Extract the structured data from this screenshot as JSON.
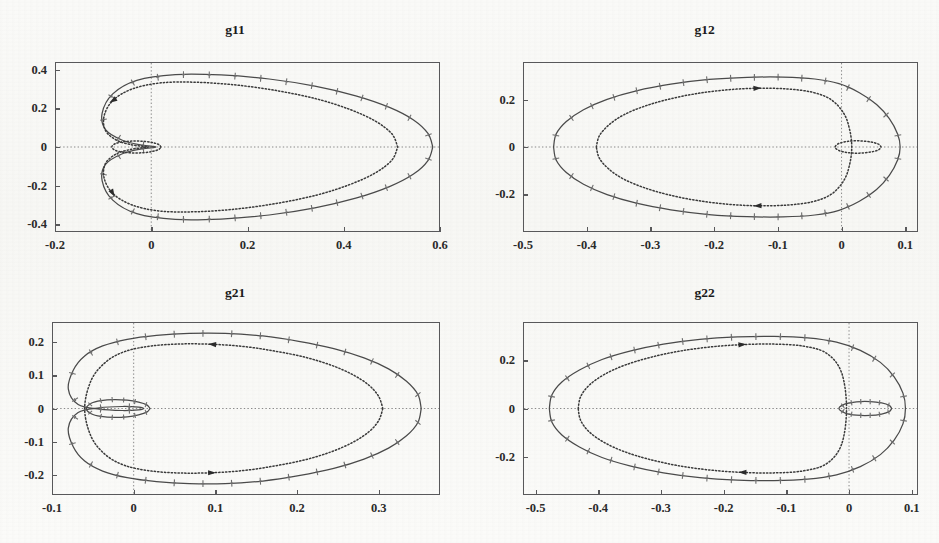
{
  "figure": {
    "background_color": "#fbfbf9",
    "axis_color": "#58585a",
    "solid_curve_color": "#4a4a4a",
    "dotted_curve_color": "#3a3a3a",
    "marker_color": "#6e6e6e",
    "panel_count": 4
  },
  "panels": [
    {
      "id": "g11",
      "title": "g11",
      "xticks": [
        "-0.2",
        "0",
        "0.2",
        "0.4",
        "0.6"
      ],
      "xtick_values": [
        -0.2,
        0,
        0.2,
        0.4,
        0.6
      ],
      "yticks": [
        "0.4",
        "0.2",
        "0",
        "-0.2",
        "-0.4"
      ],
      "ytick_values": [
        0.4,
        0.2,
        0,
        -0.2,
        -0.4
      ],
      "xlim": [
        -0.2,
        0.6
      ],
      "ylim": [
        -0.44,
        0.44
      ]
    },
    {
      "id": "g12",
      "title": "g12",
      "xticks": [
        "-0.5",
        "-0.4",
        "-0.3",
        "-0.2",
        "-0.1",
        "0",
        "0.1"
      ],
      "xtick_values": [
        -0.5,
        -0.4,
        -0.3,
        -0.2,
        -0.1,
        0,
        0.1
      ],
      "yticks": [
        "0.2",
        "0",
        "-0.2"
      ],
      "ytick_values": [
        0.2,
        0,
        -0.2
      ],
      "xlim": [
        -0.5,
        0.12
      ],
      "ylim": [
        -0.36,
        0.36
      ]
    },
    {
      "id": "g21",
      "title": "g21",
      "xticks": [
        "-0.1",
        "0",
        "0.1",
        "0.2",
        "0.3"
      ],
      "xtick_values": [
        -0.1,
        0,
        0.1,
        0.2,
        0.3
      ],
      "yticks": [
        "0.2",
        "0.1",
        "0",
        "-0.1",
        "-0.2"
      ],
      "ytick_values": [
        0.2,
        0.1,
        0,
        -0.1,
        -0.2
      ],
      "xlim": [
        -0.1,
        0.375
      ],
      "ylim": [
        -0.26,
        0.26
      ]
    },
    {
      "id": "g22",
      "title": "g22",
      "xticks": [
        "-0.5",
        "-0.4",
        "-0.3",
        "-0.2",
        "-0.1",
        "0",
        "0.1"
      ],
      "xtick_values": [
        -0.5,
        -0.4,
        -0.3,
        -0.2,
        -0.1,
        0,
        0.1
      ],
      "yticks": [
        "0.2",
        "0",
        "-0.2"
      ],
      "ytick_values": [
        0.2,
        0,
        -0.2
      ],
      "xlim": [
        -0.52,
        0.11
      ],
      "ylim": [
        -0.36,
        0.36
      ]
    }
  ],
  "chart_data": [
    {
      "type": "line",
      "title": "g11",
      "xlabel": "",
      "ylabel": "",
      "xlim": [
        -0.2,
        0.6
      ],
      "ylim": [
        -0.44,
        0.44
      ],
      "xticks": [
        -0.2,
        0,
        0.2,
        0.4,
        0.6
      ],
      "yticks": [
        -0.4,
        -0.2,
        0,
        0.2,
        0.4
      ],
      "grid": false,
      "legend": "none",
      "annotations": [
        "dotted crosshair lines at x=0 and y=0"
      ],
      "series": [
        {
          "name": "outer-solid-with-plus-markers",
          "style": "solid",
          "marker": "plus",
          "shape": "cardioid-outer-loop",
          "x": [
            0.585,
            0.575,
            0.545,
            0.495,
            0.425,
            0.34,
            0.245,
            0.145,
            0.05,
            -0.03,
            -0.08,
            -0.102,
            -0.095,
            -0.06,
            -0.02,
            0.005,
            0.01,
            0.005,
            -0.02,
            -0.06,
            -0.095,
            -0.102,
            -0.08,
            -0.03,
            0.05,
            0.145,
            0.245,
            0.34,
            0.425,
            0.495,
            0.545,
            0.575,
            0.585
          ],
          "y": [
            0.0,
            0.07,
            0.14,
            0.205,
            0.265,
            0.315,
            0.352,
            0.373,
            0.375,
            0.345,
            0.275,
            0.175,
            0.09,
            0.035,
            0.01,
            0.003,
            0.0,
            -0.003,
            -0.01,
            -0.035,
            -0.09,
            -0.175,
            -0.275,
            -0.345,
            -0.375,
            -0.373,
            -0.352,
            -0.315,
            -0.265,
            -0.205,
            -0.14,
            -0.07,
            0.0
          ]
        },
        {
          "name": "inner-dotted-loop",
          "style": "dotted",
          "marker": "arrow",
          "shape": "inner-ellipse",
          "x": [
            0.512,
            0.5,
            0.465,
            0.412,
            0.345,
            0.265,
            0.18,
            0.095,
            0.02,
            -0.04,
            -0.08,
            -0.098,
            -0.095,
            -0.072,
            -0.042,
            -0.018,
            -0.006,
            -0.018,
            -0.042,
            -0.072,
            -0.095,
            -0.098,
            -0.08,
            -0.04,
            0.02,
            0.095,
            0.18,
            0.265,
            0.345,
            0.412,
            0.465,
            0.5,
            0.512
          ],
          "y": [
            0.0,
            0.068,
            0.135,
            0.195,
            0.248,
            0.29,
            0.32,
            0.335,
            0.332,
            0.3,
            0.24,
            0.16,
            0.085,
            0.035,
            0.012,
            0.004,
            0.0,
            -0.004,
            -0.012,
            -0.035,
            -0.085,
            -0.16,
            -0.24,
            -0.3,
            -0.332,
            -0.335,
            -0.32,
            -0.29,
            -0.248,
            -0.195,
            -0.135,
            -0.068,
            0.0
          ]
        },
        {
          "name": "small-dotted-lobe-near-origin",
          "style": "dotted",
          "marker": "none",
          "shape": "small-ellipse",
          "x": [
            0.02,
            0.016,
            0.004,
            -0.014,
            -0.036,
            -0.058,
            -0.074,
            -0.082,
            -0.074,
            -0.058,
            -0.036,
            -0.014,
            0.004,
            0.016,
            0.02
          ],
          "y": [
            0.0,
            0.012,
            0.022,
            0.029,
            0.031,
            0.027,
            0.018,
            0.0,
            -0.018,
            -0.027,
            -0.031,
            -0.029,
            -0.022,
            -0.012,
            0.0
          ]
        }
      ]
    },
    {
      "type": "line",
      "title": "g12",
      "xlabel": "",
      "ylabel": "",
      "xlim": [
        -0.5,
        0.12
      ],
      "ylim": [
        -0.36,
        0.36
      ],
      "xticks": [
        -0.5,
        -0.4,
        -0.3,
        -0.2,
        -0.1,
        0,
        0.1
      ],
      "yticks": [
        -0.2,
        0,
        0.2
      ],
      "grid": false,
      "legend": "none",
      "annotations": [
        "dotted crosshair lines at x=0 and y=0"
      ],
      "series": [
        {
          "name": "outer-solid-with-plus-markers",
          "style": "solid",
          "marker": "plus",
          "shape": "cardioid-outer-loop",
          "x": [
            -0.452,
            -0.448,
            -0.432,
            -0.405,
            -0.368,
            -0.322,
            -0.268,
            -0.208,
            -0.148,
            -0.092,
            -0.042,
            -0.004,
            0.028,
            0.055,
            0.075,
            0.088,
            0.092,
            0.088,
            0.075,
            0.055,
            0.028,
            -0.004,
            -0.042,
            -0.092,
            -0.148,
            -0.208,
            -0.268,
            -0.322,
            -0.368,
            -0.405,
            -0.432,
            -0.448,
            -0.452
          ],
          "y": [
            0.0,
            0.055,
            0.108,
            0.158,
            0.202,
            0.238,
            0.266,
            0.286,
            0.295,
            0.296,
            0.288,
            0.268,
            0.23,
            0.18,
            0.12,
            0.055,
            0.0,
            -0.055,
            -0.12,
            -0.18,
            -0.23,
            -0.268,
            -0.288,
            -0.296,
            -0.295,
            -0.286,
            -0.266,
            -0.238,
            -0.202,
            -0.158,
            -0.108,
            -0.055,
            0.0
          ]
        },
        {
          "name": "inner-dotted-loop",
          "style": "dotted",
          "marker": "arrow",
          "shape": "inner-ellipse",
          "x": [
            -0.385,
            -0.38,
            -0.365,
            -0.342,
            -0.31,
            -0.272,
            -0.228,
            -0.18,
            -0.132,
            -0.086,
            -0.046,
            -0.016,
            0.004,
            0.013,
            0.016,
            0.013,
            0.004,
            -0.016,
            -0.046,
            -0.086,
            -0.132,
            -0.18,
            -0.228,
            -0.272,
            -0.31,
            -0.342,
            -0.365,
            -0.38,
            -0.385
          ],
          "y": [
            0.0,
            0.048,
            0.094,
            0.136,
            0.172,
            0.202,
            0.226,
            0.242,
            0.249,
            0.246,
            0.232,
            0.2,
            0.14,
            0.07,
            0.0,
            -0.07,
            -0.14,
            -0.2,
            -0.232,
            -0.246,
            -0.249,
            -0.242,
            -0.226,
            -0.202,
            -0.172,
            -0.136,
            -0.094,
            -0.048,
            0.0
          ]
        },
        {
          "name": "small-dotted-lobe-near-origin",
          "style": "dotted",
          "marker": "none",
          "shape": "small-ellipse",
          "x": [
            0.062,
            0.058,
            0.046,
            0.028,
            0.01,
            -0.004,
            -0.01,
            -0.004,
            0.01,
            0.028,
            0.046,
            0.058,
            0.062
          ],
          "y": [
            0.0,
            0.012,
            0.021,
            0.026,
            0.024,
            0.015,
            0.0,
            -0.015,
            -0.024,
            -0.026,
            -0.021,
            -0.012,
            0.0
          ]
        }
      ]
    },
    {
      "type": "line",
      "title": "g21",
      "xlabel": "",
      "ylabel": "",
      "xlim": [
        -0.1,
        0.375
      ],
      "ylim": [
        -0.26,
        0.26
      ],
      "xticks": [
        -0.1,
        0,
        0.1,
        0.2,
        0.3
      ],
      "yticks": [
        -0.2,
        -0.1,
        0,
        0.1,
        0.2
      ],
      "grid": false,
      "legend": "none",
      "annotations": [
        "dotted crosshair lines at x=0 and y=0"
      ],
      "series": [
        {
          "name": "outer-solid-with-plus-markers",
          "style": "solid",
          "marker": "plus",
          "shape": "cardioid-outer-loop",
          "x": [
            0.352,
            0.348,
            0.334,
            0.312,
            0.282,
            0.245,
            0.202,
            0.158,
            0.112,
            0.068,
            0.028,
            -0.008,
            -0.038,
            -0.06,
            -0.074,
            -0.08,
            -0.068,
            -0.042,
            -0.014,
            0.006,
            0.012,
            0.006,
            -0.014,
            -0.042,
            -0.068,
            -0.08,
            -0.074,
            -0.06,
            -0.038,
            -0.008,
            0.028,
            0.068,
            0.112,
            0.158,
            0.202,
            0.245,
            0.282,
            0.312,
            0.334,
            0.348,
            0.352
          ],
          "y": [
            0.0,
            0.042,
            0.082,
            0.119,
            0.152,
            0.18,
            0.202,
            0.218,
            0.226,
            0.226,
            0.22,
            0.208,
            0.188,
            0.158,
            0.115,
            0.058,
            0.012,
            -0.002,
            -0.006,
            -0.004,
            0.0,
            0.004,
            0.006,
            0.002,
            -0.012,
            -0.058,
            -0.115,
            -0.158,
            -0.188,
            -0.208,
            -0.22,
            -0.226,
            -0.226,
            -0.218,
            -0.202,
            -0.18,
            -0.152,
            -0.119,
            -0.082,
            -0.042,
            0.0
          ]
        },
        {
          "name": "inner-dotted-loop",
          "style": "dotted",
          "marker": "arrow",
          "shape": "inner-ellipse",
          "x": [
            0.305,
            0.3,
            0.288,
            0.268,
            0.242,
            0.21,
            0.174,
            0.136,
            0.096,
            0.058,
            0.022,
            -0.01,
            -0.034,
            -0.052,
            -0.06,
            -0.052,
            -0.034,
            -0.01,
            0.022,
            0.058,
            0.096,
            0.136,
            0.174,
            0.21,
            0.242,
            0.268,
            0.288,
            0.3,
            0.305
          ],
          "y": [
            0.0,
            0.036,
            0.07,
            0.102,
            0.13,
            0.154,
            0.172,
            0.186,
            0.193,
            0.194,
            0.188,
            0.172,
            0.14,
            0.085,
            0.0,
            -0.085,
            -0.14,
            -0.172,
            -0.188,
            -0.194,
            -0.193,
            -0.186,
            -0.172,
            -0.154,
            -0.13,
            -0.102,
            -0.07,
            -0.036,
            0.0
          ]
        },
        {
          "name": "small-solid-lobe-near-origin",
          "style": "solid",
          "marker": "plus",
          "shape": "small-ellipse",
          "x": [
            0.02,
            0.016,
            0.006,
            -0.008,
            -0.024,
            -0.04,
            -0.052,
            -0.058,
            -0.052,
            -0.04,
            -0.024,
            -0.008,
            0.006,
            0.016,
            0.02
          ],
          "y": [
            0.0,
            0.011,
            0.019,
            0.025,
            0.027,
            0.024,
            0.016,
            0.0,
            -0.016,
            -0.024,
            -0.027,
            -0.025,
            -0.019,
            -0.011,
            0.0
          ]
        }
      ]
    },
    {
      "type": "line",
      "title": "g22",
      "xlabel": "",
      "ylabel": "",
      "xlim": [
        -0.52,
        0.11
      ],
      "ylim": [
        -0.36,
        0.36
      ],
      "xticks": [
        -0.5,
        -0.4,
        -0.3,
        -0.2,
        -0.1,
        0,
        0.1
      ],
      "yticks": [
        -0.2,
        0,
        0.2
      ],
      "grid": false,
      "legend": "none",
      "annotations": [
        "dotted crosshair lines at x=0 and y=0"
      ],
      "series": [
        {
          "name": "outer-solid-with-plus-markers",
          "style": "solid",
          "marker": "plus",
          "shape": "cardioid-outer-loop",
          "x": [
            -0.478,
            -0.474,
            -0.458,
            -0.43,
            -0.394,
            -0.348,
            -0.296,
            -0.238,
            -0.178,
            -0.12,
            -0.066,
            -0.02,
            0.018,
            0.05,
            0.072,
            0.086,
            0.09,
            0.086,
            0.072,
            0.05,
            0.018,
            -0.02,
            -0.066,
            -0.12,
            -0.178,
            -0.238,
            -0.296,
            -0.348,
            -0.394,
            -0.43,
            -0.458,
            -0.474,
            -0.478
          ],
          "y": [
            0.0,
            0.056,
            0.11,
            0.16,
            0.204,
            0.24,
            0.268,
            0.288,
            0.298,
            0.3,
            0.294,
            0.276,
            0.242,
            0.192,
            0.132,
            0.064,
            0.0,
            -0.064,
            -0.132,
            -0.192,
            -0.242,
            -0.276,
            -0.294,
            -0.3,
            -0.298,
            -0.288,
            -0.268,
            -0.24,
            -0.204,
            -0.16,
            -0.11,
            -0.056,
            0.0
          ]
        },
        {
          "name": "inner-dotted-loop",
          "style": "dotted",
          "marker": "arrow",
          "shape": "inner-ellipse",
          "x": [
            -0.432,
            -0.428,
            -0.414,
            -0.39,
            -0.358,
            -0.318,
            -0.272,
            -0.222,
            -0.17,
            -0.12,
            -0.074,
            -0.036,
            -0.012,
            -0.004,
            -0.012,
            -0.036,
            -0.074,
            -0.12,
            -0.17,
            -0.222,
            -0.272,
            -0.318,
            -0.358,
            -0.39,
            -0.414,
            -0.428,
            -0.432
          ],
          "y": [
            0.0,
            0.05,
            0.098,
            0.142,
            0.18,
            0.212,
            0.238,
            0.256,
            0.266,
            0.268,
            0.26,
            0.23,
            0.15,
            0.0,
            -0.15,
            -0.23,
            -0.26,
            -0.268,
            -0.266,
            -0.256,
            -0.238,
            -0.212,
            -0.18,
            -0.142,
            -0.098,
            -0.05,
            0.0
          ]
        },
        {
          "name": "small-solid-lobe-near-origin",
          "style": "solid",
          "marker": "plus",
          "shape": "small-ellipse",
          "x": [
            0.068,
            0.064,
            0.052,
            0.034,
            0.012,
            -0.006,
            -0.016,
            -0.006,
            0.012,
            0.034,
            0.052,
            0.064,
            0.068
          ],
          "y": [
            0.0,
            0.013,
            0.023,
            0.029,
            0.028,
            0.019,
            0.0,
            -0.019,
            -0.028,
            -0.029,
            -0.023,
            -0.013,
            0.0
          ]
        }
      ]
    }
  ]
}
